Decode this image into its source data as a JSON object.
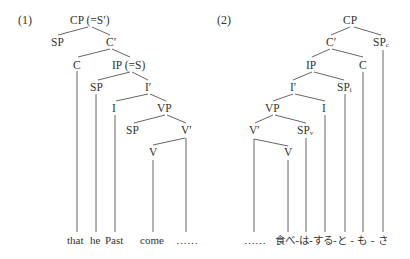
{
  "tree1": {
    "number": "(1)",
    "nodes": {
      "cp": "CP (=S′)",
      "sp_cp": "SP",
      "c_bar": "C′",
      "c": "C",
      "ip": "IP (=S)",
      "sp_ip": "SP",
      "i_bar": "I′",
      "i": "I",
      "vp": "VP",
      "sp_vp": "SP",
      "v_bar": "V′",
      "v": "V"
    },
    "leaves": {
      "that": "that",
      "he": "he",
      "past": "Past",
      "come": "come",
      "ellipsis": "……"
    }
  },
  "tree2": {
    "number": "(2)",
    "nodes": {
      "cp": "CP",
      "c_bar": "C′",
      "sp_c": "SP",
      "sp_c_sub": "c",
      "ip": "IP",
      "c": "C",
      "i_bar": "I′",
      "sp_i": "SP",
      "sp_i_sub": "i",
      "vp": "VP",
      "i": "I",
      "v_bar": "V′",
      "sp_v": "SP",
      "sp_v_sub": "v",
      "v": "V"
    },
    "leaves": {
      "ellipsis": "……",
      "phrase": "食べ-は-する-と - も - さ"
    }
  }
}
